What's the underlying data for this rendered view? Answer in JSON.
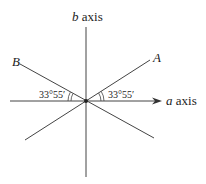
{
  "diagram": {
    "axes": {
      "a_axis": {
        "variable": "a",
        "suffix": " axis"
      },
      "b_axis": {
        "variable": "b",
        "suffix": " axis"
      }
    },
    "lines": {
      "A": {
        "label": "A"
      },
      "B": {
        "label": "B"
      }
    },
    "angles": {
      "left": "33°55′",
      "right": "33°55′"
    },
    "colors": {
      "stroke": "#333333",
      "text": "#222222"
    }
  }
}
